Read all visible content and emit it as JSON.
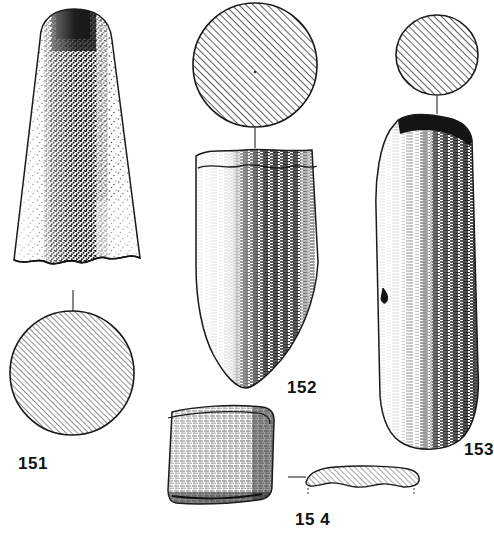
{
  "plate": {
    "kind": "archaeological-artefact-plate",
    "background_color": "#ffffff",
    "ink_color": "#1a1a1a",
    "width": 494,
    "height": 533
  },
  "figures": [
    {
      "id": "151",
      "label": "151",
      "name": "ground-stone-adze-151",
      "views": [
        "elevation",
        "cross-section"
      ],
      "elevation": {
        "shape": "tapered-trapezoid-with-domed-butt-and-broken-base",
        "texture": "stipple",
        "shading": "dark-vertical-band-centre-right",
        "bounds": {
          "x": 10,
          "y": 8,
          "width": 140,
          "height": 280
        }
      },
      "cross_section": {
        "shape": "circle",
        "hatch": "diagonal-45-up-right",
        "center_x": 72,
        "center_y": 373,
        "radius": 62
      },
      "leader_line": {
        "x": 72,
        "y1": 290,
        "y2": 311
      }
    },
    {
      "id": "152",
      "label": "152",
      "name": "ground-stone-adze-152",
      "views": [
        "cross-section",
        "elevation"
      ],
      "cross_section": {
        "shape": "circle",
        "hatch": "diagonal-45-up-right",
        "center_x": 255,
        "center_y": 65,
        "radius": 62
      },
      "leader_line": {
        "x": 255,
        "y1": 127,
        "y2": 147
      },
      "elevation": {
        "shape": "tapered-blade-rounded-point",
        "texture": "horizontal-hatch",
        "shading": "dark-band-right-of-centre",
        "bounds": {
          "x": 192,
          "y": 146,
          "width": 134,
          "height": 243
        }
      }
    },
    {
      "id": "153",
      "label": "153",
      "name": "ground-stone-adze-153",
      "views": [
        "cross-section",
        "elevation"
      ],
      "cross_section": {
        "shape": "circle",
        "hatch": "diagonal-45-up-right",
        "center_x": 437,
        "center_y": 55,
        "radius": 41
      },
      "leader_line": {
        "x": 437,
        "y1": 96,
        "y2": 113
      },
      "elevation": {
        "shape": "elongated-rounded-rectangle-with-flake-notch",
        "texture": "horizontal-hatch",
        "shading": "dark-band-right-side",
        "notch": {
          "x": 385,
          "y": 295
        },
        "bounds": {
          "x": 373,
          "y": 112,
          "width": 110,
          "height": 340
        }
      }
    },
    {
      "id": "154",
      "label": "15 4",
      "name": "flat-stone-plaque-154",
      "views": [
        "plan",
        "edge-profile"
      ],
      "plan": {
        "shape": "sub-square-plate",
        "texture": "fine-cross-hatch",
        "bounds": {
          "x": 167,
          "y": 404,
          "width": 110,
          "height": 103
        }
      },
      "edge_profile": {
        "shape": "thin-lens",
        "hatch": "diagonal-45-up-right",
        "bounds": {
          "x": 305,
          "y": 466,
          "width": 116,
          "height": 23
        },
        "tick_marks": [
          "left-end",
          "right-end"
        ]
      },
      "leader_line": {
        "y": 477,
        "x1": 288,
        "x2": 306
      }
    }
  ]
}
